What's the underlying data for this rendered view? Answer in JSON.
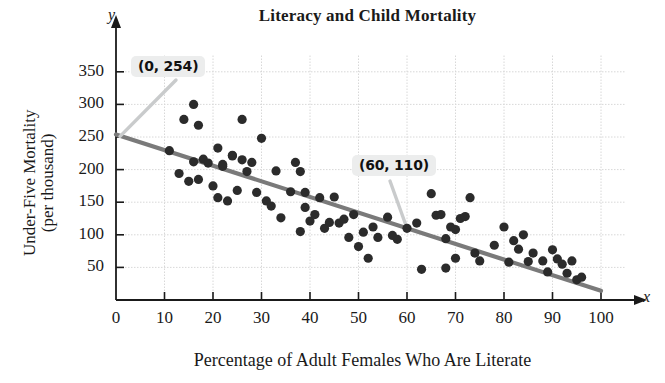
{
  "chart_data": {
    "type": "scatter",
    "title": "Literacy and Child Mortality",
    "xlabel": "Percentage of Adult Females Who Are Literate",
    "ylabel_line1": "Under-Five Mortality",
    "ylabel_line2": "(per thousand)",
    "x_axis_letter": "x",
    "y_axis_letter": "y",
    "xlim": [
      0,
      100
    ],
    "ylim": [
      0,
      375
    ],
    "xticks": [
      0,
      10,
      20,
      30,
      40,
      50,
      60,
      70,
      80,
      90,
      100
    ],
    "yticks": [
      50,
      100,
      150,
      200,
      250,
      300,
      350
    ],
    "grid": true,
    "grid_color": "#d8d8d8",
    "point_color": "#2b2b2b",
    "line_color": "#7a7a7a",
    "legend": "none",
    "trend_line": {
      "name": "least-squares regression line",
      "intercept": 254,
      "slope": -2.4,
      "x_start": 0,
      "y_start": 254,
      "x_end": 100,
      "y_end": 14
    },
    "annotations": [
      {
        "label": "(0, 254)",
        "x": 0,
        "y": 254
      },
      {
        "label": "(60, 110)",
        "x": 60,
        "y": 110
      }
    ],
    "points": [
      [
        11,
        229
      ],
      [
        13,
        194
      ],
      [
        14,
        277
      ],
      [
        15,
        182
      ],
      [
        16,
        300
      ],
      [
        16,
        212
      ],
      [
        17,
        185
      ],
      [
        17,
        268
      ],
      [
        18,
        216
      ],
      [
        19,
        210
      ],
      [
        20,
        175
      ],
      [
        21,
        157
      ],
      [
        21,
        233
      ],
      [
        22,
        208
      ],
      [
        22,
        205
      ],
      [
        23,
        152
      ],
      [
        24,
        222
      ],
      [
        24,
        221
      ],
      [
        25,
        168
      ],
      [
        26,
        277
      ],
      [
        26,
        215
      ],
      [
        27,
        197
      ],
      [
        28,
        211
      ],
      [
        29,
        165
      ],
      [
        30,
        248
      ],
      [
        31,
        152
      ],
      [
        32,
        144
      ],
      [
        33,
        198
      ],
      [
        34,
        126
      ],
      [
        36,
        166
      ],
      [
        37,
        211
      ],
      [
        38,
        105
      ],
      [
        38,
        197
      ],
      [
        39,
        165
      ],
      [
        39,
        142
      ],
      [
        40,
        121
      ],
      [
        41,
        131
      ],
      [
        42,
        157
      ],
      [
        43,
        110
      ],
      [
        44,
        119
      ],
      [
        45,
        158
      ],
      [
        46,
        118
      ],
      [
        47,
        124
      ],
      [
        48,
        96
      ],
      [
        49,
        131
      ],
      [
        50,
        82
      ],
      [
        51,
        104
      ],
      [
        52,
        64
      ],
      [
        53,
        112
      ],
      [
        54,
        96
      ],
      [
        56,
        127
      ],
      [
        57,
        99
      ],
      [
        58,
        93
      ],
      [
        60,
        110
      ],
      [
        62,
        118
      ],
      [
        63,
        47
      ],
      [
        65,
        163
      ],
      [
        66,
        130
      ],
      [
        67,
        131
      ],
      [
        68,
        94
      ],
      [
        68,
        49
      ],
      [
        69,
        112
      ],
      [
        70,
        108
      ],
      [
        70,
        64
      ],
      [
        71,
        125
      ],
      [
        72,
        128
      ],
      [
        73,
        157
      ],
      [
        74,
        72
      ],
      [
        75,
        60
      ],
      [
        78,
        84
      ],
      [
        80,
        112
      ],
      [
        81,
        58
      ],
      [
        82,
        91
      ],
      [
        83,
        78
      ],
      [
        84,
        100
      ],
      [
        85,
        59
      ],
      [
        86,
        72
      ],
      [
        88,
        60
      ],
      [
        89,
        43
      ],
      [
        90,
        77
      ],
      [
        91,
        63
      ],
      [
        92,
        55
      ],
      [
        93,
        41
      ],
      [
        94,
        60
      ],
      [
        95,
        31
      ],
      [
        96,
        35
      ]
    ]
  }
}
